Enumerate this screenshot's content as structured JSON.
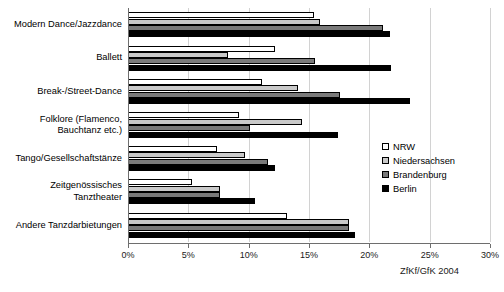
{
  "chart_data": {
    "type": "bar",
    "orientation": "horizontal",
    "title": "",
    "xlabel": "",
    "ylabel": "",
    "xlim": [
      0,
      30
    ],
    "xticks": [
      0,
      5,
      10,
      15,
      20,
      25,
      30
    ],
    "xtick_labels": [
      "0%",
      "5%",
      "10%",
      "15%",
      "20%",
      "25%",
      "30%"
    ],
    "grid": true,
    "legend_position": "right",
    "categories": [
      "Modern Dance/Jazzdance",
      "Ballett",
      "Break-/Street-Dance",
      "Folklore (Flamenco,\nBauchtanz etc.)",
      "Tango/Gesellschaftstänze",
      "Zeitgenössisches\nTanztheater",
      "Andere Tanzdarbietungen"
    ],
    "series": [
      {
        "name": "NRW",
        "color": "#ffffff",
        "values": [
          15.4,
          12.2,
          11.1,
          9.2,
          7.4,
          5.3,
          13.2
        ]
      },
      {
        "name": "Niedersachsen",
        "color": "#c9c9c9",
        "values": [
          15.9,
          8.3,
          14.1,
          14.4,
          9.7,
          7.6,
          18.3
        ]
      },
      {
        "name": "Brandenburg",
        "color": "#7a7a7a",
        "values": [
          21.1,
          15.5,
          17.6,
          10.1,
          11.6,
          7.6,
          18.3
        ]
      },
      {
        "name": "Berlin",
        "color": "#000000",
        "values": [
          21.7,
          21.8,
          23.4,
          17.4,
          12.2,
          10.5,
          18.8
        ]
      }
    ],
    "source_note": "ZfKf/GfK 2004"
  }
}
